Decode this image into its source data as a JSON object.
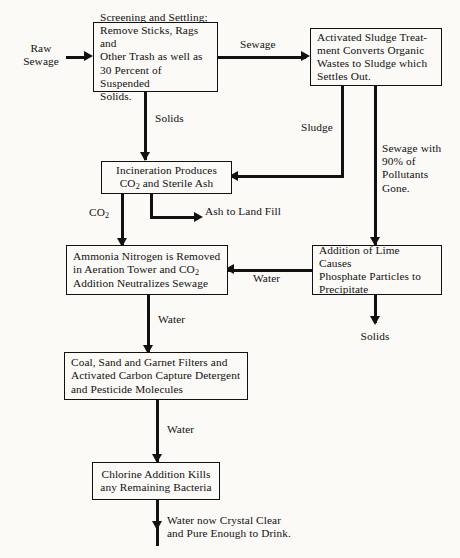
{
  "diagram": {
    "background_color": "#fbfaf7",
    "line_color": "#111111",
    "boxes": [
      {
        "id": "screening",
        "text": "Screening and Settling;\nRemove Sticks, Rags and\nOther Trash as well as\n30 Percent of Suspended\nSolids."
      },
      {
        "id": "activated-sludge",
        "text": "Activated Sludge Treat-\nment Converts Organic\nWastes to Sludge which\nSettles Out."
      },
      {
        "id": "incineration",
        "text": "Incineration Produces\nCO2 and Sterile Ash"
      },
      {
        "id": "ammonia",
        "text": "Ammonia Nitrogen is Removed\nin Aeration Tower and CO2\nAddition Neutralizes Sewage"
      },
      {
        "id": "lime",
        "text": "Addition of Lime Causes\nPhosphate Particles to\nPrecipitate"
      },
      {
        "id": "filters",
        "text": "Coal, Sand and Garnet Filters and\nActivated Carbon Capture Detergent\nand Pesticide Molecules"
      },
      {
        "id": "chlorine",
        "text": "Chlorine Addition Kills\nany Remaining Bacteria"
      }
    ],
    "labels": {
      "raw_sewage": "Raw\nSewage",
      "sewage": "Sewage",
      "solids_from_screening": "Solids",
      "sludge": "Sludge",
      "sewage_with_90": "Sewage with\n90% of\nPollutants\nGone.",
      "co2": "CO2",
      "ash_to_land_fill": "Ash to Land Fill",
      "water_from_lime": "Water",
      "solids_from_lime": "Solids",
      "water_to_filters": "Water",
      "water_to_chlorine": "Water",
      "final_output": "Water  now  Crystal  Clear\nand Pure Enough to Drink."
    }
  }
}
